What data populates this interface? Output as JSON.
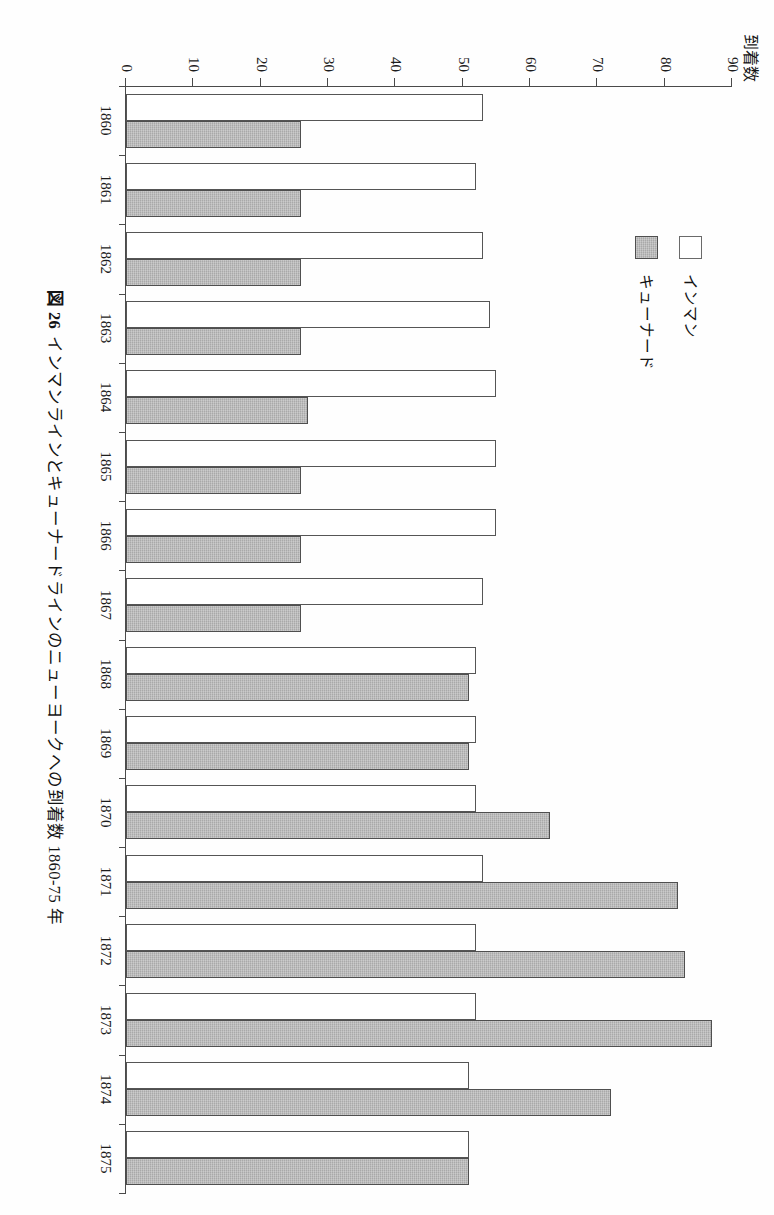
{
  "figure": {
    "number_label": "図 26",
    "caption": "インマンラインとキューナードラインのニューヨークへの到着数 1860-75 年"
  },
  "legend": {
    "position": "upper-left-inside",
    "items": [
      {
        "label": "インマン",
        "swatch": "white-square",
        "color": "#ffffff"
      },
      {
        "label": "キューナード",
        "swatch": "gray-square",
        "color": "#a9a9a9"
      }
    ]
  },
  "axes": {
    "value_axis_title": "到着数",
    "value_ticks": [
      "0",
      "10",
      "20",
      "30",
      "40",
      "50",
      "60",
      "70",
      "80",
      "90"
    ],
    "category_ticks": [
      "1860",
      "1861",
      "1862",
      "1863",
      "1864",
      "1865",
      "1866",
      "1867",
      "1868",
      "1869",
      "1870",
      "1871",
      "1872",
      "1873",
      "1874",
      "1875"
    ]
  },
  "chart_data": {
    "type": "bar",
    "orientation": "horizontal-printed-sideways",
    "xlabel": "",
    "ylabel": "到着数",
    "ylim": [
      0,
      90
    ],
    "ytick_step": 10,
    "grid": false,
    "legend_position": "upper left",
    "categories": [
      "1860",
      "1861",
      "1862",
      "1863",
      "1864",
      "1865",
      "1866",
      "1867",
      "1868",
      "1869",
      "1870",
      "1871",
      "1872",
      "1873",
      "1874",
      "1875"
    ],
    "series": [
      {
        "name": "インマン",
        "color": "#ffffff",
        "values": [
          53,
          52,
          53,
          54,
          55,
          55,
          55,
          53,
          52,
          52,
          52,
          53,
          52,
          52,
          51,
          51
        ]
      },
      {
        "name": "キューナード",
        "color": "#a9a9a9",
        "values": [
          26,
          26,
          26,
          26,
          27,
          26,
          26,
          26,
          51,
          51,
          63,
          82,
          83,
          87,
          72,
          51
        ]
      }
    ]
  }
}
